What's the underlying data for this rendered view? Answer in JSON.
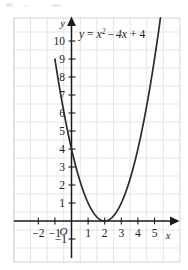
{
  "figure": {
    "name": "parabola-graph",
    "equation_label": "y = x² − 4x + 4",
    "equation_parts": {
      "lhs": "y",
      "equals": "=",
      "term1_base": "x",
      "term1_exp": "2",
      "minus": "−",
      "term2": "4x",
      "plus": "+",
      "term3": "4"
    },
    "origin_label": "O",
    "x_axis_name": "x",
    "y_axis_name": "y"
  },
  "chart_data": {
    "type": "line",
    "title": "",
    "subtitle": "",
    "annotations": [
      "y = x² − 4x + 4"
    ],
    "xlabel": "x",
    "ylabel": "y",
    "xlim": [
      -2.8,
      5.9
    ],
    "ylim": [
      -1.7,
      10.9
    ],
    "grid": true,
    "legend": "none",
    "x_ticks": [
      -2,
      -1,
      1,
      2,
      3,
      4,
      5
    ],
    "x_tick_labels": [
      "−2",
      "−1",
      "1",
      "2",
      "3",
      "4",
      "5"
    ],
    "y_ticks": [
      -1,
      1,
      2,
      3,
      4,
      5,
      6,
      7,
      8,
      9,
      10
    ],
    "y_tick_labels": [
      "−1",
      "1",
      "2",
      "3",
      "4",
      "5",
      "6",
      "7",
      "8",
      "9",
      "10"
    ],
    "series": [
      {
        "name": "y = x^2 - 4x + 4",
        "equation": "y = x^2 - 4x + 4",
        "vertex": [
          2,
          0
        ],
        "y_intercept": [
          0,
          4
        ],
        "x_intercepts": [
          [
            2,
            0
          ]
        ],
        "color": "#2b2b2b",
        "x": [
          -0.65,
          -0.4,
          -0.2,
          0,
          0.25,
          0.5,
          0.75,
          1,
          1.25,
          1.5,
          1.75,
          2,
          2.25,
          2.5,
          2.75,
          3,
          3.25,
          3.5,
          3.75,
          4,
          4.25,
          4.5,
          4.75,
          5,
          5.25
        ],
        "y": [
          7.02,
          5.76,
          4.84,
          4,
          3.06,
          2.25,
          1.56,
          1,
          0.56,
          0.25,
          0.06,
          0,
          0.06,
          0.25,
          0.56,
          1,
          1.56,
          2.25,
          3.06,
          4,
          5.06,
          6.25,
          7.56,
          9,
          10.56
        ]
      }
    ]
  }
}
